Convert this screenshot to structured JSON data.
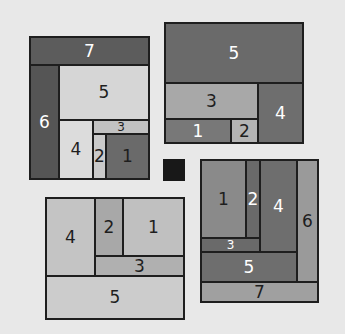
{
  "panels": [
    {
      "id": "top-left",
      "cells": [
        {
          "label": "7",
          "x": 29,
          "y": 36,
          "w": 121,
          "h": 30,
          "fill": "#5c5c5c",
          "text": "#ffffff"
        },
        {
          "label": "6",
          "x": 29,
          "y": 64,
          "w": 31,
          "h": 116,
          "fill": "#555555",
          "text": "#ffffff"
        },
        {
          "label": "5",
          "x": 58,
          "y": 64,
          "w": 92,
          "h": 57,
          "fill": "#d6d6d6",
          "text": "#1e1e1e"
        },
        {
          "label": "3",
          "x": 92,
          "y": 119,
          "w": 58,
          "h": 16,
          "fill": "#c2c2c2",
          "text": "#1e1e1e",
          "small": true
        },
        {
          "label": "4",
          "x": 58,
          "y": 119,
          "w": 36,
          "h": 61,
          "fill": "#dcdcdc",
          "text": "#1e1e1e"
        },
        {
          "label": "2",
          "x": 92,
          "y": 133,
          "w": 15,
          "h": 47,
          "fill": "#cacaca",
          "text": "#1e1e1e"
        },
        {
          "label": "1",
          "x": 105,
          "y": 133,
          "w": 45,
          "h": 47,
          "fill": "#6a6a6a",
          "text": "#1e1e1e"
        }
      ]
    },
    {
      "id": "top-right",
      "cells": [
        {
          "label": "5",
          "x": 164,
          "y": 22,
          "w": 140,
          "h": 62,
          "fill": "#6a6a6a",
          "text": "#ffffff"
        },
        {
          "label": "3",
          "x": 164,
          "y": 82,
          "w": 95,
          "h": 38,
          "fill": "#a8a8a8",
          "text": "#1e1e1e"
        },
        {
          "label": "4",
          "x": 257,
          "y": 82,
          "w": 47,
          "h": 62,
          "fill": "#6e6e6e",
          "text": "#ffffff"
        },
        {
          "label": "1",
          "x": 164,
          "y": 118,
          "w": 68,
          "h": 26,
          "fill": "#787878",
          "text": "#ffffff"
        },
        {
          "label": "2",
          "x": 230,
          "y": 118,
          "w": 29,
          "h": 26,
          "fill": "#b4b4b4",
          "text": "#1e1e1e"
        }
      ]
    },
    {
      "id": "bottom-left",
      "cells": [
        {
          "label": "4",
          "x": 45,
          "y": 197,
          "w": 51,
          "h": 80,
          "fill": "#c4c4c4",
          "text": "#1e1e1e"
        },
        {
          "label": "2",
          "x": 94,
          "y": 197,
          "w": 30,
          "h": 60,
          "fill": "#a8a8a8",
          "text": "#1e1e1e"
        },
        {
          "label": "1",
          "x": 122,
          "y": 197,
          "w": 63,
          "h": 60,
          "fill": "#c0c0c0",
          "text": "#1e1e1e"
        },
        {
          "label": "3",
          "x": 94,
          "y": 255,
          "w": 91,
          "h": 22,
          "fill": "#b0b0b0",
          "text": "#1e1e1e"
        },
        {
          "label": "5",
          "x": 45,
          "y": 275,
          "w": 140,
          "h": 45,
          "fill": "#cccccc",
          "text": "#1e1e1e"
        }
      ]
    },
    {
      "id": "bottom-right",
      "cells": [
        {
          "label": "1",
          "x": 200,
          "y": 159,
          "w": 47,
          "h": 80,
          "fill": "#8a8a8a",
          "text": "#1e1e1e"
        },
        {
          "label": "2",
          "x": 245,
          "y": 159,
          "w": 16,
          "h": 80,
          "fill": "#6a6a6a",
          "text": "#ffffff"
        },
        {
          "label": "4",
          "x": 259,
          "y": 159,
          "w": 39,
          "h": 94,
          "fill": "#6e6e6e",
          "text": "#ffffff"
        },
        {
          "label": "6",
          "x": 296,
          "y": 159,
          "w": 23,
          "h": 124,
          "fill": "#9a9a9a",
          "text": "#1e1e1e"
        },
        {
          "label": "3",
          "x": 200,
          "y": 237,
          "w": 61,
          "h": 16,
          "fill": "#6a6a6a",
          "text": "#ffffff",
          "small": true
        },
        {
          "label": "5",
          "x": 200,
          "y": 251,
          "w": 98,
          "h": 32,
          "fill": "#6e6e6e",
          "text": "#ffffff"
        },
        {
          "label": "7",
          "x": 200,
          "y": 281,
          "w": 119,
          "h": 22,
          "fill": "#a0a0a0",
          "text": "#1e1e1e"
        }
      ]
    }
  ],
  "center_square": {
    "fill": "#181818"
  },
  "background": "#e8e8e8"
}
